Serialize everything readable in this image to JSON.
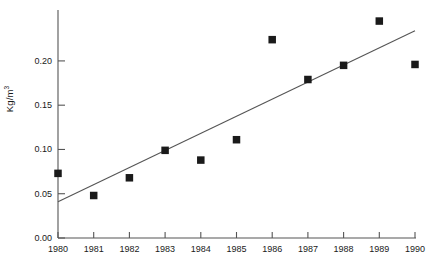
{
  "chart_data": {
    "type": "scatter",
    "title": "",
    "subtitle": "",
    "xlabel": "",
    "ylabel": "Kg/m3",
    "ylabel_display": "Kg/m",
    "ylabel_superscript": "3",
    "categories": [
      "1980",
      "1981",
      "1982",
      "1983",
      "1984",
      "1985",
      "1986",
      "1987",
      "1988",
      "1989",
      "1990"
    ],
    "x": [
      1980,
      1981,
      1982,
      1983,
      1984,
      1985,
      1986,
      1987,
      1988,
      1989,
      1990
    ],
    "values": [
      0.073,
      0.048,
      0.068,
      0.099,
      0.088,
      0.111,
      0.224,
      0.179,
      0.195,
      0.245,
      0.196
    ],
    "series": [
      {
        "name": "observations",
        "marker": "square",
        "marker_color": "#1a1a1a",
        "values": [
          0.073,
          0.048,
          0.068,
          0.099,
          0.088,
          0.111,
          0.224,
          0.179,
          0.195,
          0.245,
          0.196
        ]
      },
      {
        "name": "trend-line",
        "type": "line",
        "line_color": "#555555",
        "endpoints": [
          {
            "x": 1980,
            "y": 0.041
          },
          {
            "x": 1990,
            "y": 0.234
          }
        ]
      }
    ],
    "ylim": [
      0.0,
      0.2575
    ],
    "xlim": [
      1980,
      1990
    ],
    "yticks": [
      0.0,
      0.05,
      0.1,
      0.15,
      0.2
    ],
    "ytick_labels": [
      "0.00",
      "0.05",
      "0.10",
      "0.15",
      "0.20"
    ],
    "xticks": [
      1980,
      1981,
      1982,
      1983,
      1984,
      1985,
      1986,
      1987,
      1988,
      1989,
      1990
    ],
    "xtick_labels": [
      "1980",
      "1981",
      "1982",
      "1983",
      "1984",
      "1985",
      "1986",
      "1987",
      "1988",
      "1989",
      "1990"
    ],
    "grid": false,
    "legend": null,
    "axis_color": "#555555",
    "background_color": "#ffffff"
  }
}
